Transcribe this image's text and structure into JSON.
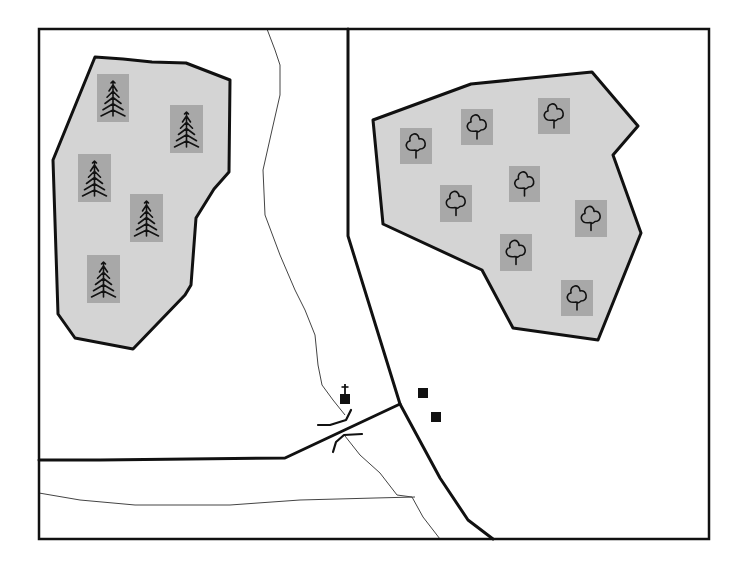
{
  "map": {
    "width": 740,
    "height": 565,
    "colors": {
      "background": "#ffffff",
      "woodland_fill": "#d4d4d4",
      "icon_box": "#a8a8a8",
      "line": "#111111",
      "stream": "#444444"
    },
    "frame": {
      "x": 39,
      "y": 29,
      "width": 670,
      "height": 510
    },
    "woodlands": [
      {
        "id": "coniferous-woodland",
        "type": "coniferous",
        "points": "95,57 123,59 152,62 186,63 230,80 229,172 214,189 196,218 191,285 185,295 133,349 75,338 58,314 53,160",
        "trees": [
          {
            "x": 97,
            "y": 74,
            "w": 32,
            "h": 48
          },
          {
            "x": 170,
            "y": 105,
            "w": 33,
            "h": 48
          },
          {
            "x": 78,
            "y": 154,
            "w": 33,
            "h": 48
          },
          {
            "x": 130,
            "y": 194,
            "w": 33,
            "h": 48
          },
          {
            "x": 87,
            "y": 255,
            "w": 33,
            "h": 48
          }
        ]
      },
      {
        "id": "deciduous-woodland",
        "type": "deciduous",
        "points": "373,120 471,84 592,72 638,126 613,155 641,233 598,340 513,328 482,270 383,224",
        "trees": [
          {
            "x": 400,
            "y": 128,
            "w": 32,
            "h": 36
          },
          {
            "x": 461,
            "y": 109,
            "w": 32,
            "h": 36
          },
          {
            "x": 538,
            "y": 98,
            "w": 32,
            "h": 36
          },
          {
            "x": 509,
            "y": 166,
            "w": 31,
            "h": 36
          },
          {
            "x": 440,
            "y": 185,
            "w": 32,
            "h": 37
          },
          {
            "x": 575,
            "y": 200,
            "w": 32,
            "h": 37
          },
          {
            "x": 500,
            "y": 234,
            "w": 32,
            "h": 37
          },
          {
            "x": 561,
            "y": 280,
            "w": 32,
            "h": 36
          }
        ]
      }
    ],
    "roads": {
      "major": [
        {
          "id": "road-north-south",
          "points": "348,29 348,236 400,404 440,478 468,520 493,539"
        },
        {
          "id": "road-west",
          "points": "39,460 100,460 285,458 400,404"
        }
      ],
      "minor": [
        {
          "id": "track-south",
          "points": "39,493 80,500 135,505 230,505 300,500 375,498 415,497"
        }
      ]
    },
    "streams": [
      {
        "id": "stream-upper",
        "points": "267,29 275,50 280,65 280,95 272,130 263,170 265,215 280,255 295,290 305,310 315,335 318,365 322,385 333,400 345,415"
      },
      {
        "id": "stream-lower",
        "points": "345,436 360,455 380,473 397,495 412,497 423,517 440,539"
      }
    ],
    "bridge": {
      "north_parapet": "318,425 330,425 346,420 351,410",
      "south_parapet": "333,452 336,442 344,435 362,434"
    },
    "church": {
      "x": 340,
      "y": 394,
      "size": 10,
      "cross_top": 384
    },
    "buildings": [
      {
        "id": "building-1",
        "x": 418,
        "y": 388,
        "size": 10
      },
      {
        "id": "building-2",
        "x": 431,
        "y": 412,
        "size": 10
      }
    ]
  }
}
